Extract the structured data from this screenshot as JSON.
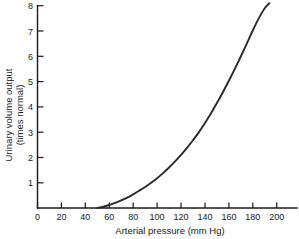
{
  "chart_data": {
    "type": "line",
    "title": "",
    "xlabel": "Arterial pressure (mm Hg)",
    "ylabel_line1": "Urinary volume output",
    "ylabel_line2": "(times normal)",
    "xlim": [
      0,
      217
    ],
    "ylim": [
      0,
      8
    ],
    "xticks": [
      0,
      20,
      40,
      60,
      80,
      100,
      120,
      140,
      160,
      180,
      200
    ],
    "xtick_labels": [
      "0",
      "20",
      "40",
      "60",
      "80",
      "100",
      "120",
      "140",
      "160",
      "180",
      "200"
    ],
    "yticks": [
      1,
      2,
      3,
      4,
      5,
      6,
      7,
      8
    ],
    "ytick_labels": [
      "1",
      "2",
      "3",
      "4",
      "5",
      "6",
      "7",
      "8"
    ],
    "grid": false,
    "legend": "none",
    "series": [
      {
        "name": "Urinary volume output",
        "color": "#2a2a2a",
        "x": [
          50,
          55,
          60,
          65,
          70,
          75,
          80,
          85,
          90,
          95,
          100,
          105,
          110,
          115,
          120,
          125,
          130,
          135,
          140,
          145,
          150,
          155,
          160,
          165,
          170,
          175,
          180,
          185,
          190,
          194
        ],
        "y": [
          0.0,
          0.05,
          0.12,
          0.2,
          0.3,
          0.41,
          0.54,
          0.68,
          0.83,
          1.0,
          1.18,
          1.38,
          1.6,
          1.84,
          2.1,
          2.38,
          2.68,
          3.0,
          3.36,
          3.74,
          4.15,
          4.58,
          5.03,
          5.5,
          5.99,
          6.5,
          7.02,
          7.5,
          7.9,
          8.1
        ]
      }
    ],
    "annotations": []
  },
  "figure": {
    "background_color": "#ffffff",
    "axis_color": "#1a1a1a",
    "curve_color": "#2a2a2a"
  }
}
